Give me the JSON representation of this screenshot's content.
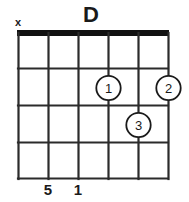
{
  "diagram": {
    "title": "D",
    "instrument_strings": 6,
    "frets_shown": 4,
    "nut_shown": true,
    "string_markers": [
      "x",
      "",
      "",
      "",
      "",
      ""
    ],
    "fret_dots": [
      {
        "label": "1",
        "string_index": 3,
        "fret": 2
      },
      {
        "label": "2",
        "string_index": 5,
        "fret": 2
      },
      {
        "label": "3",
        "string_index": 4,
        "fret": 3
      }
    ],
    "bottom_labels": [
      "",
      "5",
      "1",
      "",
      "",
      ""
    ],
    "colors": {
      "background": "#ffffff",
      "line": "#2b2b2b",
      "nut": "#111111",
      "text": "#1a1a1a",
      "dot_fill": "#ffffff",
      "dot_stroke": "#1a1a1a"
    }
  }
}
